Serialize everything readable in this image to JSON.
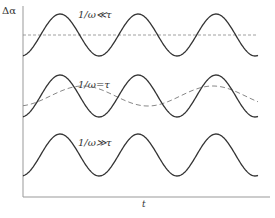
{
  "figure": {
    "y_axis_label": "Δα",
    "x_axis_label": "t",
    "curves": [
      {
        "label": "1/ω≪τ",
        "solid": "sinusoid, large amplitude",
        "dashed": "flat line (mean)"
      },
      {
        "label": "1/ω=τ",
        "solid": "sinusoid, large amplitude",
        "dashed": "smaller amplitude, phase-lagged sinusoid"
      },
      {
        "label": "1/ω≫τ",
        "solid": "sinusoid, large amplitude",
        "dashed": "none (coincides with solid)"
      }
    ],
    "colors": {
      "line": "#333333",
      "dashed": "#888888",
      "axis": "#999999"
    }
  }
}
